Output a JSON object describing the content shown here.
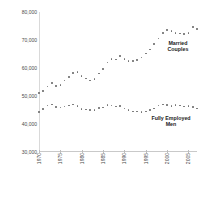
{
  "chart_data": {
    "type": "scatter",
    "title": "",
    "subtitle": "",
    "xlabel": "",
    "ylabel": "",
    "grid": false,
    "legend_position": "inline-annotation",
    "xlim": [
      1970,
      2007
    ],
    "ylim": [
      30000,
      80000
    ],
    "y_ticks": [
      30000,
      40000,
      50000,
      60000,
      70000,
      80000
    ],
    "y_tick_labels": [
      "30,000",
      "40,000",
      "50,000",
      "60,000",
      "70,000",
      "80,000"
    ],
    "x_ticks": [
      1970,
      1975,
      1980,
      1985,
      1990,
      1995,
      2000,
      2005
    ],
    "x_tick_labels": [
      "1970",
      "1975",
      "1980",
      "1985",
      "1990",
      "1995",
      "2000",
      "2005"
    ],
    "x": [
      1970,
      1971,
      1972,
      1973,
      1974,
      1975,
      1976,
      1977,
      1978,
      1979,
      1980,
      1981,
      1982,
      1983,
      1984,
      1985,
      1986,
      1987,
      1988,
      1989,
      1990,
      1991,
      1992,
      1993,
      1994,
      1995,
      1996,
      1997,
      1998,
      1999,
      2000,
      2001,
      2002,
      2003,
      2004,
      2005,
      2006,
      2007
    ],
    "series": [
      {
        "name": "Married Couples",
        "color": "#6e6e6e",
        "values": [
          51000,
          51800,
          53400,
          54600,
          53600,
          53900,
          55500,
          56700,
          58200,
          58600,
          57200,
          56200,
          55500,
          56100,
          58000,
          59600,
          62000,
          63300,
          63000,
          64200,
          63200,
          62600,
          62400,
          62900,
          63700,
          65200,
          66600,
          68500,
          70600,
          72400,
          73600,
          73300,
          72600,
          72300,
          72100,
          72500,
          74600,
          73900
        ]
      },
      {
        "name": "Fully Employed Men",
        "color": "#6e6e6e",
        "values": [
          44300,
          45400,
          46600,
          46900,
          46100,
          45900,
          46300,
          46600,
          46900,
          46400,
          45400,
          45200,
          45000,
          45100,
          45700,
          45900,
          46700,
          46600,
          46200,
          46400,
          45500,
          44900,
          44400,
          44400,
          44200,
          44500,
          44900,
          45500,
          46600,
          46900,
          46800,
          46500,
          46700,
          46600,
          46300,
          46400,
          46100,
          45600
        ]
      }
    ],
    "annotations": [
      {
        "text_line1": "Married",
        "text_line2": "Couples",
        "target_series": "Married Couples"
      },
      {
        "text_line1": "Fully Employed",
        "text_line2": "Men",
        "target_series": "Fully Employed Men"
      }
    ]
  },
  "colors": {
    "background": "#ffffff",
    "dot": "#6e6e6e",
    "axis": "#d9d9d9",
    "tick_text": "#4a4a4a",
    "annotation_text": "#1c1c1c"
  }
}
